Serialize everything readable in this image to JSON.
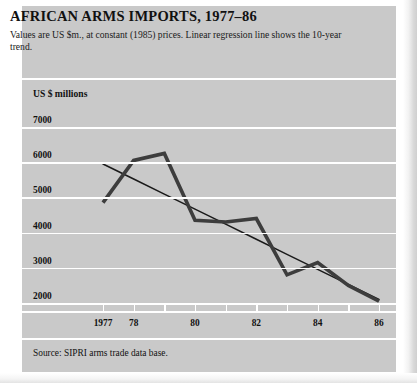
{
  "header": {
    "title": "AFRICAN ARMS IMPORTS, 1977–86",
    "subtitle": "Values are US $m., at constant (1985) prices. Linear regression line shows the 10-year trend."
  },
  "axis": {
    "y_label": "US $ millions",
    "y_ticks": [
      "7000",
      "6000",
      "5000",
      "4000",
      "3000",
      "2000"
    ],
    "x_ticks": [
      "1977",
      "78",
      "",
      "80",
      "",
      "82",
      "",
      "84",
      "",
      "86"
    ]
  },
  "footer": {
    "source": "Source: SIPRI arms trade data base."
  },
  "colors": {
    "panel_background": "#c9c9c9",
    "page_background": "#ffffff",
    "gridline": "#ffffff",
    "data_line": "#3a3a3a",
    "trend_line": "#1a1a1a",
    "text": "#111111"
  },
  "chart_data": {
    "type": "line",
    "title": "AFRICAN ARMS IMPORTS, 1977–86",
    "subtitle": "Values are US $m., at constant (1985) prices. Linear regression line shows the 10-year trend.",
    "xlabel": "",
    "ylabel": "US $ millions",
    "x": [
      1977,
      1978,
      1979,
      1980,
      1981,
      1982,
      1983,
      1984,
      1985,
      1986
    ],
    "x_tick_labels": [
      "1977",
      "78",
      "",
      "80",
      "",
      "82",
      "",
      "84",
      "",
      "86"
    ],
    "xlim": [
      1977,
      1986
    ],
    "ylim": [
      1700,
      7300
    ],
    "y_ticks": [
      7000,
      6000,
      5000,
      4000,
      3000,
      2000
    ],
    "grid": true,
    "legend": "none",
    "series": [
      {
        "name": "African arms imports",
        "type": "line",
        "values": [
          4850,
          6050,
          6250,
          4350,
          4300,
          4400,
          2800,
          3150,
          2500,
          2050
        ]
      },
      {
        "name": "Linear regression (10-year trend)",
        "type": "line",
        "values": [
          5950,
          5522,
          5094,
          4667,
          4239,
          3811,
          3383,
          2956,
          2528,
          2100
        ]
      }
    ],
    "source": "Source: SIPRI arms trade data base."
  }
}
